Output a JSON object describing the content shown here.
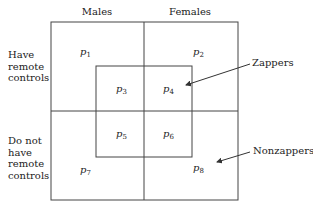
{
  "columns": [
    "Males",
    "Females"
  ],
  "rows": [
    {
      "label": "Have remote controls",
      "lines": [
        "Have",
        "remote",
        "controls"
      ]
    },
    {
      "label": "Do not have remote controls",
      "lines": [
        "Do not",
        "have",
        "remote",
        "controls"
      ]
    }
  ],
  "cells": [
    {
      "base": "p",
      "sub": "1"
    },
    {
      "base": "p",
      "sub": "2"
    },
    {
      "base": "p",
      "sub": "3"
    },
    {
      "base": "p",
      "sub": "4"
    },
    {
      "base": "p",
      "sub": "5"
    },
    {
      "base": "p",
      "sub": "6"
    },
    {
      "base": "p",
      "sub": "7"
    },
    {
      "base": "p",
      "sub": "8"
    }
  ],
  "callouts": {
    "zappers": "Zappers",
    "nonzappers": "Nonzappers"
  },
  "colors": {
    "line": "#444444",
    "text": "#222222"
  }
}
